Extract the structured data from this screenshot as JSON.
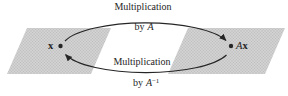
{
  "figure": {
    "background": "#ffffff",
    "ink": "#262626",
    "plane": {
      "fill": "#d2d2d2",
      "dot": "#b9b9b9"
    },
    "labels": {
      "forward": {
        "line1": "Multiplication",
        "by": "by",
        "operator": "A"
      },
      "inverse": {
        "line1": "Multiplication",
        "by": "by",
        "operator": "A",
        "exponent": "−1"
      },
      "left_point": "x",
      "right_point_operator": "A",
      "right_point_vector": "x"
    }
  }
}
